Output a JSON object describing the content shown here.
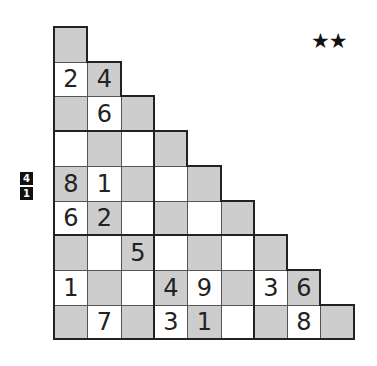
{
  "puzzle": {
    "difficulty_stars": "★★",
    "side_clue": [
      "4",
      "1"
    ],
    "grid": {
      "origin_x": 54,
      "origin_y": 27,
      "cell_w": 33.3,
      "cell_h": 34.7,
      "colors": {
        "gray": "#cdcdcd",
        "white": "#ffffff",
        "border": "#222222"
      },
      "rows": [
        {
          "shading": [
            "g"
          ],
          "values": [
            ""
          ]
        },
        {
          "shading": [
            "w",
            "g"
          ],
          "values": [
            "2",
            "4"
          ]
        },
        {
          "shading": [
            "g",
            "w",
            "g"
          ],
          "values": [
            "",
            "6",
            ""
          ]
        },
        {
          "shading": [
            "w",
            "g",
            "w",
            "g"
          ],
          "values": [
            "",
            "",
            "",
            ""
          ]
        },
        {
          "shading": [
            "g",
            "w",
            "g",
            "w",
            "g"
          ],
          "values": [
            "8",
            "1",
            "",
            "",
            ""
          ]
        },
        {
          "shading": [
            "w",
            "g",
            "w",
            "g",
            "w",
            "g"
          ],
          "values": [
            "6",
            "2",
            "",
            "",
            "",
            ""
          ]
        },
        {
          "shading": [
            "g",
            "w",
            "g",
            "w",
            "g",
            "w",
            "g"
          ],
          "values": [
            "",
            "",
            "5",
            "",
            "",
            "",
            ""
          ]
        },
        {
          "shading": [
            "w",
            "g",
            "w",
            "g",
            "w",
            "g",
            "w",
            "g"
          ],
          "values": [
            "1",
            "",
            "",
            "4",
            "9",
            "",
            "3",
            "6"
          ]
        },
        {
          "shading": [
            "g",
            "w",
            "g",
            "w",
            "g",
            "w",
            "g",
            "w",
            "g"
          ],
          "values": [
            "",
            "7",
            "",
            "3",
            "1",
            "",
            "",
            "8",
            ""
          ]
        }
      ]
    }
  }
}
